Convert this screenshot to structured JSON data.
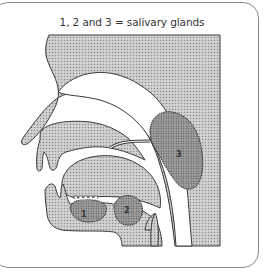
{
  "figure": {
    "caption": "1, 2 and 3 = salivary glands",
    "labels": {
      "gland_1": "1",
      "gland_2": "2",
      "gland_3": "3"
    }
  },
  "colors": {
    "tissue_fill": "#c4c4c4",
    "gland_fill": "#8e8e8e",
    "outline": "#3a3a3a",
    "frame_border": "#8a8a8a",
    "background": "#ffffff"
  }
}
